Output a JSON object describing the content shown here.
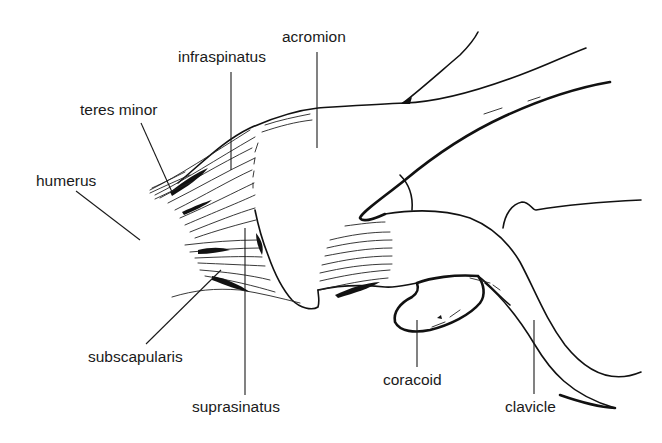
{
  "figure": {
    "type": "anatomical line drawing",
    "background": "#ffffff",
    "ink_color": "#111111"
  },
  "labels": [
    {
      "id": "acromion",
      "text": "acromion"
    },
    {
      "id": "infraspinatus",
      "text": "infraspinatus"
    },
    {
      "id": "teres_minor",
      "text": "teres minor"
    },
    {
      "id": "humerus",
      "text": "humerus"
    },
    {
      "id": "subscapularis",
      "text": "subscapularis"
    },
    {
      "id": "suprasinatus",
      "text": "suprasinatus"
    },
    {
      "id": "coracoid",
      "text": "coracoid"
    },
    {
      "id": "clavicle",
      "text": "clavicle"
    }
  ]
}
